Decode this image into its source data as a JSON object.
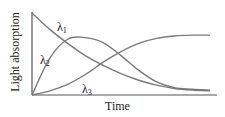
{
  "chart_data": {
    "type": "line",
    "title": "",
    "xlabel": "Time",
    "ylabel": "Light absorption",
    "grid": false,
    "legend": "inline labels",
    "x": [
      0,
      0.1,
      0.2,
      0.3,
      0.4,
      0.5,
      0.6,
      0.7,
      0.8,
      0.9,
      1.0
    ],
    "series": [
      {
        "name": "λ1",
        "label_symbol": "λ",
        "label_sub": "1",
        "values": [
          1.0,
          0.8,
          0.63,
          0.48,
          0.36,
          0.26,
          0.18,
          0.12,
          0.08,
          0.06,
          0.05
        ]
      },
      {
        "name": "λ2",
        "label_symbol": "λ",
        "label_sub": "2",
        "values": [
          0.0,
          0.45,
          0.68,
          0.7,
          0.64,
          0.48,
          0.3,
          0.16,
          0.09,
          0.07,
          0.06
        ]
      },
      {
        "name": "λ3",
        "label_symbol": "λ",
        "label_sub": "3",
        "values": [
          0.0,
          0.05,
          0.13,
          0.25,
          0.4,
          0.53,
          0.63,
          0.69,
          0.72,
          0.73,
          0.73
        ]
      }
    ],
    "xlim": [
      0,
      1
    ],
    "ylim": [
      0,
      1
    ],
    "colors": {
      "curve": "#7a7a7a",
      "axis": "#555555",
      "text": "#222222"
    }
  }
}
